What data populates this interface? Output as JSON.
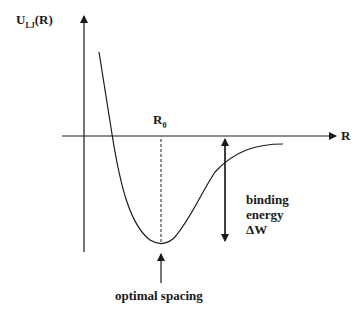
{
  "labels": {
    "y_axis_main": "U",
    "y_axis_sub": "LJ",
    "y_axis_suffix": "(R)",
    "x_axis": "R",
    "r0_main": "R",
    "r0_sub": "0",
    "binding_line1": "binding",
    "binding_line2": "energy",
    "binding_line3": "ΔW",
    "optimal": "optimal spacing"
  },
  "colors": {
    "stroke": "#1a1a1a",
    "background": "#ffffff"
  }
}
